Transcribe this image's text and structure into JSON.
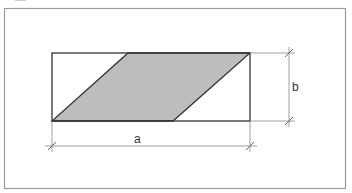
{
  "diagram": {
    "labels": {
      "width": "a",
      "height": "b"
    },
    "colors": {
      "frame": "#9a9a9a",
      "outline": "#333333",
      "fill": "#bdbdbd",
      "dimension": "#888888"
    }
  }
}
